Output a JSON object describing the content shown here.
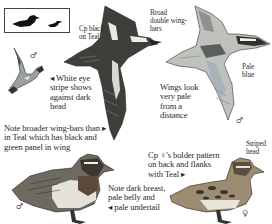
{
  "size_comparison": {
    "label": "size-silhouettes",
    "silhouettes": [
      "large-duck-silhouette",
      "small-duck-silhouette"
    ]
  },
  "annotations": {
    "cp_black_teal": "Cp black\non Teal",
    "broad_wingbars": "Broad\ndouble wing-\nbars",
    "white_eye_stripe": "◂ White eye\n   stripe shows\n   against dark\n   head",
    "wings_pale": "Wings look\nvery pale\nfrom a\ndistance",
    "pale_blue": "Pale\nblue",
    "broader_wingbars": "Note broader wing-bars than ▸\nin Teal which has black and\ngreen panel in wing",
    "female_pattern": "Cp ♀'s bolder pattern\non back and flanks\nwith Teal ▸",
    "striped_head": "Striped\nhead",
    "dark_breast": "Note dark breast,\npale belly and\n◂ pale undertail"
  },
  "sex_symbols": {
    "flying_small_male": "♂",
    "flying_large_male": "♂",
    "standing_male": "♂",
    "standing_female": "♀"
  },
  "colors": {
    "ink": "#2a2a2a",
    "plumage_dark": "#3b3e3a",
    "plumage_mid": "#7d7f78",
    "plumage_light": "#c9c7bd",
    "wing_blue_grey": "#a9b4b8",
    "breast_brown": "#6e5a48",
    "female_brown": "#8a7a62",
    "background": "#ffffff"
  }
}
